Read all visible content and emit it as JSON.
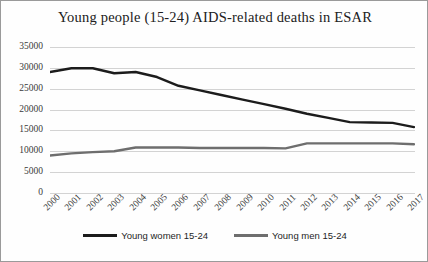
{
  "chart_data": {
    "type": "line",
    "title": "Young people (15-24) AIDS-related deaths in ESAR",
    "xlabel": "",
    "ylabel": "",
    "ylim": [
      0,
      35000
    ],
    "ytick_step": 5000,
    "yticks": [
      "35000",
      "30000",
      "25000",
      "20000",
      "15000",
      "10000",
      "5000",
      "0"
    ],
    "grid": true,
    "legend_position": "bottom",
    "categories": [
      "2000",
      "2001",
      "2002",
      "2003",
      "2004",
      "2005",
      "2006",
      "2007",
      "2008",
      "2009",
      "2010",
      "2011",
      "2012",
      "2013",
      "2014",
      "2015",
      "2016",
      "2017"
    ],
    "series": [
      {
        "name": "Young women 15-24",
        "color": "#1c1c1c",
        "values": [
          29000,
          29900,
          29900,
          28700,
          29000,
          27800,
          25700,
          24600,
          23500,
          22400,
          21300,
          20200,
          19000,
          18000,
          17000,
          16900,
          16800,
          15800
        ]
      },
      {
        "name": "Young men 15-24",
        "color": "#6e6e6e",
        "values": [
          9000,
          9500,
          9800,
          10000,
          10900,
          10900,
          10900,
          10800,
          10800,
          10800,
          10800,
          10700,
          11900,
          11900,
          11900,
          11900,
          11900,
          11700
        ]
      }
    ]
  },
  "legend": {
    "items": [
      {
        "label": "Young women 15-24",
        "color": "#1c1c1c"
      },
      {
        "label": "Young men 15-24",
        "color": "#6e6e6e"
      }
    ]
  }
}
